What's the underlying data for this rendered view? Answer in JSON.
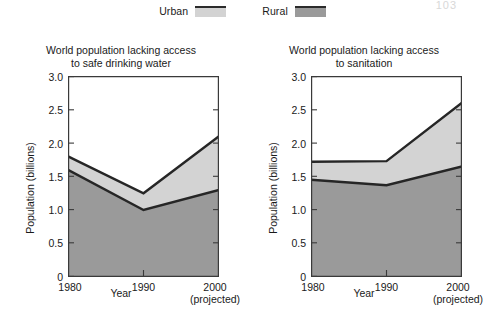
{
  "page_number_faint": "103",
  "legend": {
    "entries": [
      {
        "label": "Urban",
        "color": "#d3d3d3",
        "icon": "legend-swatch"
      },
      {
        "label": "Rural",
        "color": "#9a9a9a",
        "icon": "legend-swatch"
      }
    ]
  },
  "charts": [
    {
      "title_line1": "World population lacking access",
      "title_line2": "to safe drinking water",
      "ylabel": "Population (billions)",
      "xlabel": "Year",
      "yticks": [
        "0",
        "0.5",
        "1.0",
        "1.5",
        "2.0",
        "2.5",
        "3.0"
      ],
      "xticks": [
        {
          "label": "1980",
          "sub": ""
        },
        {
          "label": "1990",
          "sub": ""
        },
        {
          "label": "2000",
          "sub": "(projected)"
        }
      ]
    },
    {
      "title_line1": "World population lacking access",
      "title_line2": "to sanitation",
      "ylabel": "Population (billions)",
      "xlabel": "Year",
      "yticks": [
        "0",
        "0.5",
        "1.0",
        "1.5",
        "2.0",
        "2.5",
        "3.0"
      ],
      "xticks": [
        {
          "label": "1980",
          "sub": ""
        },
        {
          "label": "1990",
          "sub": ""
        },
        {
          "label": "2000",
          "sub": "(projected)"
        }
      ]
    }
  ],
  "chart_data": [
    {
      "type": "area",
      "stacked": true,
      "title": "World population lacking access to safe drinking water",
      "xlabel": "Year",
      "ylabel": "Population (billions)",
      "x": [
        1980,
        1990,
        2000
      ],
      "xtick_labels": [
        "1980",
        "1990",
        "2000 (projected)"
      ],
      "ylim": [
        0,
        3.0
      ],
      "yticks": [
        0,
        0.5,
        1.0,
        1.5,
        2.0,
        2.5,
        3.0
      ],
      "grid": false,
      "legend_position": "top-center",
      "series": [
        {
          "name": "Rural",
          "values": [
            1.6,
            1.0,
            1.3
          ],
          "color": "#9a9a9a"
        },
        {
          "name": "Urban",
          "values": [
            0.2,
            0.25,
            0.8
          ],
          "color": "#d3d3d3"
        }
      ],
      "cumulative_tops": {
        "Rural": [
          1.6,
          1.0,
          1.3
        ],
        "Urban": [
          1.8,
          1.25,
          2.1
        ]
      },
      "annotations": []
    },
    {
      "type": "area",
      "stacked": true,
      "title": "World population lacking access to sanitation",
      "xlabel": "Year",
      "ylabel": "Population (billions)",
      "x": [
        1980,
        1990,
        2000
      ],
      "xtick_labels": [
        "1980",
        "1990",
        "2000 (projected)"
      ],
      "ylim": [
        0,
        3.0
      ],
      "yticks": [
        0,
        0.5,
        1.0,
        1.5,
        2.0,
        2.5,
        3.0
      ],
      "grid": false,
      "legend_position": "top-center",
      "series": [
        {
          "name": "Rural",
          "values": [
            1.45,
            1.37,
            1.65
          ],
          "color": "#9a9a9a"
        },
        {
          "name": "Urban",
          "values": [
            0.27,
            0.36,
            0.95
          ],
          "color": "#d3d3d3"
        }
      ],
      "cumulative_tops": {
        "Rural": [
          1.45,
          1.37,
          1.65
        ],
        "Urban": [
          1.72,
          1.73,
          2.6
        ]
      },
      "annotations": []
    }
  ]
}
